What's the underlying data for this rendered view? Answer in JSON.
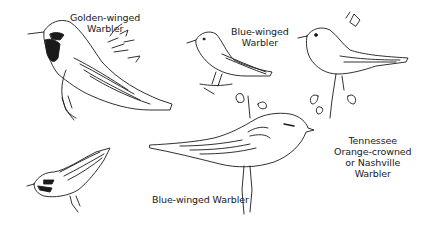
{
  "plate": {
    "background": "#ffffff",
    "ink": "#1a1a1a",
    "labels": {
      "golden_winged": [
        "Golden-winged",
        "Warbler"
      ],
      "blue_winged_top": [
        "Blue-winged",
        "Warbler"
      ],
      "tennessee": [
        "Tennessee",
        "Orange-crowned",
        "or Nashville",
        "Warbler"
      ],
      "blue_winged_bottom": "Blue-winged Warbler"
    },
    "birds": [
      {
        "name": "Golden-winged Warbler",
        "position": "top-left"
      },
      {
        "name": "Blue-winged Warbler",
        "position": "top-center"
      },
      {
        "name": "Tennessee / Orange-crowned / Nashville Warbler",
        "position": "top-right"
      },
      {
        "name": "Blue-winged Warbler",
        "position": "bottom-center"
      },
      {
        "name": "Golden-winged Warbler (small)",
        "position": "bottom-left"
      }
    ]
  }
}
